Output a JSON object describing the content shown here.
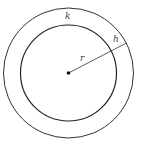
{
  "diagram": {
    "type": "concentric-circles",
    "center": {
      "x": 68.5,
      "y": 73
    },
    "outer_circle": {
      "radius": 65,
      "label": "k"
    },
    "inner_circle": {
      "radius": 48
    },
    "radius_line": {
      "from": [
        68.5,
        73
      ],
      "to": [
        126.5,
        43
      ],
      "label_inner": "r",
      "label_ring": "h"
    },
    "labels": {
      "k": "k",
      "r": "r",
      "h": "h"
    },
    "colors": {
      "stroke": "#333333",
      "text": "#444444",
      "background": "#ffffff"
    }
  }
}
